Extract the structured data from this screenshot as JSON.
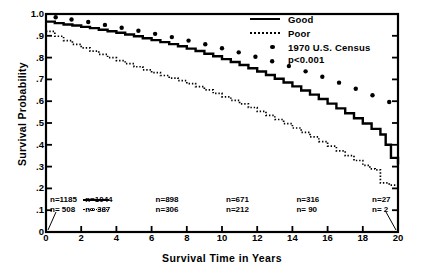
{
  "chart_data": {
    "type": "line",
    "title": "",
    "xlabel": "Survival Time in Years",
    "ylabel": "Survival Probability",
    "xlim": [
      0,
      20
    ],
    "ylim": [
      0,
      1.0
    ],
    "xticks": [
      "0",
      "2",
      "4",
      "6",
      "8",
      "10",
      "12",
      "14",
      "16",
      "18",
      "20"
    ],
    "xtick_values": [
      0,
      2,
      4,
      6,
      8,
      10,
      12,
      14,
      16,
      18,
      20
    ],
    "yticks": [
      "0",
      ".1",
      ".2",
      ".3",
      ".4",
      ".5",
      ".6",
      ".7",
      ".8",
      ".9",
      "1.0"
    ],
    "ytick_values": [
      0,
      0.1,
      0.2,
      0.3,
      0.4,
      0.5,
      0.6,
      0.7,
      0.8,
      0.9,
      1.0
    ],
    "grid": false,
    "legend_position": "top-right",
    "annotation": "p<0.001",
    "series": [
      {
        "name": "Good",
        "style": "solid-step",
        "x": [
          0,
          0.5,
          1,
          1.5,
          2,
          2.5,
          3,
          3.5,
          4,
          4.5,
          5,
          5.5,
          6,
          6.5,
          7,
          7.5,
          8,
          8.5,
          9,
          9.5,
          10,
          10.5,
          11,
          11.5,
          12,
          12.5,
          13,
          13.5,
          14,
          14.5,
          15,
          15.5,
          16,
          16.5,
          17,
          17.5,
          18,
          18.5,
          19,
          19.3,
          19.6,
          20
        ],
        "y": [
          0.965,
          0.958,
          0.952,
          0.947,
          0.941,
          0.935,
          0.928,
          0.921,
          0.914,
          0.906,
          0.898,
          0.889,
          0.88,
          0.871,
          0.862,
          0.852,
          0.841,
          0.83,
          0.818,
          0.806,
          0.793,
          0.78,
          0.766,
          0.751,
          0.736,
          0.72,
          0.703,
          0.686,
          0.668,
          0.649,
          0.63,
          0.61,
          0.589,
          0.567,
          0.545,
          0.522,
          0.498,
          0.473,
          0.447,
          0.4,
          0.34,
          0.31
        ]
      },
      {
        "name": "Poor",
        "style": "dotted-step",
        "x": [
          0,
          0.5,
          1,
          1.5,
          2,
          2.5,
          3,
          3.5,
          4,
          4.5,
          5,
          5.5,
          6,
          6.5,
          7,
          7.5,
          8,
          8.5,
          9,
          9.5,
          10,
          10.5,
          11,
          11.5,
          12,
          12.5,
          13,
          13.5,
          14,
          14.5,
          15,
          15.5,
          16,
          16.5,
          17,
          17.5,
          18,
          18.4,
          18.7,
          19,
          19.5,
          20
        ],
        "y": [
          0.92,
          0.898,
          0.878,
          0.861,
          0.845,
          0.83,
          0.815,
          0.8,
          0.786,
          0.772,
          0.758,
          0.744,
          0.731,
          0.718,
          0.706,
          0.694,
          0.681,
          0.667,
          0.652,
          0.636,
          0.62,
          0.604,
          0.588,
          0.571,
          0.553,
          0.535,
          0.516,
          0.497,
          0.477,
          0.457,
          0.436,
          0.415,
          0.394,
          0.372,
          0.35,
          0.328,
          0.306,
          0.29,
          0.285,
          0.225,
          0.215,
          0.212
        ]
      },
      {
        "name": "1970 U.S. Census",
        "style": "dots",
        "x": [
          0.55,
          1.45,
          2.4,
          3.35,
          4.3,
          5.25,
          6.2,
          7.15,
          8.1,
          9.05,
          10.0,
          10.95,
          11.9,
          12.85,
          13.8,
          14.75,
          15.7,
          16.65,
          17.6,
          18.55,
          19.5
        ],
        "y": [
          0.985,
          0.975,
          0.963,
          0.95,
          0.937,
          0.923,
          0.909,
          0.894,
          0.878,
          0.861,
          0.843,
          0.824,
          0.804,
          0.783,
          0.761,
          0.737,
          0.712,
          0.685,
          0.657,
          0.627,
          0.596
        ]
      }
    ]
  },
  "legend": {
    "items": [
      {
        "label": "Good",
        "key": "solid-line-key"
      },
      {
        "label": "Poor",
        "key": "dotted-line-key"
      },
      {
        "label": "1970 U.S. Census",
        "key": "dot-marker-key"
      }
    ],
    "pvalue": "p<0.001"
  },
  "at_risk": {
    "good_row": [
      {
        "text": "n=1185"
      },
      {
        "text": "n=1044"
      },
      {
        "text": "n=898"
      },
      {
        "text": "n=671"
      },
      {
        "text": "n=316"
      },
      {
        "text": "n=27"
      }
    ],
    "poor_row": [
      {
        "text": "n= 508"
      },
      {
        "text": "n= 387"
      },
      {
        "text": "n=306"
      },
      {
        "text": "n=212"
      },
      {
        "text": "n= 90"
      },
      {
        "text": "n= 2"
      }
    ]
  },
  "colors": {
    "ink": "#000000",
    "background": "#ffffff"
  }
}
